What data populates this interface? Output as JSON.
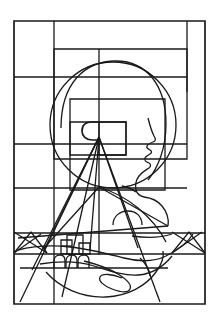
{
  "artwork": {
    "title": "Head in Profile with Radiating Vision and Landscape",
    "medium": "line drawing",
    "background_color": "#ffffff",
    "stroke_color": "#1a1a1a",
    "canvas": {
      "width": 220,
      "height": 324
    },
    "elements": {
      "outer_frame": "outer-rectangle-border",
      "grid": "nested-rectangles-and-rule-lines",
      "head_circle": "large-circle-head-halo",
      "face_profile": "human-profile-facing-right",
      "eye": "c-shaped-eye-notch",
      "rays": "radiating-sight-lines-from-eye",
      "landscape": "lower-scene-with-buildings-trees-mountains-river",
      "hand": "open-hand-cradling-landscape"
    },
    "counts": {
      "rays": 7,
      "buildings": 3,
      "trees": 3,
      "mountains": 2,
      "horizontal_rules": 6,
      "vertical_rules": 3
    },
    "labels": {
      "figure_caption": "Head in Profile with Radiating Vision and Landscape"
    }
  }
}
